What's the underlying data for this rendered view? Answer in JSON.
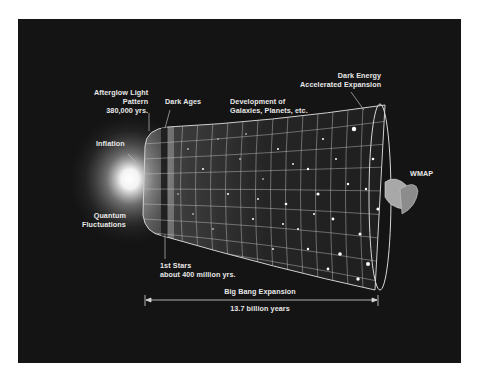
{
  "figure": {
    "colors": {
      "background": "#141414",
      "page": "#ffffff",
      "text": "#e8e8e8",
      "grid": "#bfbfbf",
      "glow": "#ffffff"
    }
  },
  "labels": {
    "afterglow": {
      "line1": "Afterglow Light",
      "line2": "Pattern",
      "line3": "380,000 yrs."
    },
    "dark_ages": "Dark Ages",
    "inflation": "Inflation",
    "quantum": {
      "line1": "Quantum",
      "line2": "Fluctuations"
    },
    "development": {
      "line1": "Development of",
      "line2": "Galaxies, Planets, etc."
    },
    "dark_energy": {
      "line1": "Dark Energy",
      "line2": "Accelerated Expansion"
    },
    "wmap": "WMAP",
    "first_stars": {
      "line1": "1st Stars",
      "line2": "about 400 million yrs."
    },
    "expansion": {
      "title": "Big Bang Expansion",
      "duration": "13.7 billion years"
    }
  },
  "icons": {
    "satellite": "wmap-satellite",
    "glow": "big-bang-glow"
  }
}
